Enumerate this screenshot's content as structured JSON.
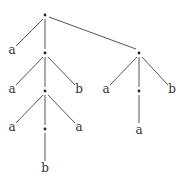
{
  "diagram": {
    "type": "tree",
    "nodes": [
      {
        "id": "n0",
        "kind": "internal",
        "x": 45,
        "y": 15
      },
      {
        "id": "n1",
        "kind": "leaf",
        "label": "a",
        "x": 12,
        "y": 52
      },
      {
        "id": "n2",
        "kind": "internal",
        "x": 45,
        "y": 53
      },
      {
        "id": "n3",
        "kind": "internal",
        "x": 139,
        "y": 53
      },
      {
        "id": "n4",
        "kind": "leaf",
        "label": "a",
        "x": 12,
        "y": 91
      },
      {
        "id": "n5",
        "kind": "internal",
        "x": 45,
        "y": 91
      },
      {
        "id": "n6",
        "kind": "leaf",
        "label": "b",
        "x": 79,
        "y": 91
      },
      {
        "id": "n7",
        "kind": "leaf",
        "label": "a",
        "x": 106,
        "y": 91
      },
      {
        "id": "n8",
        "kind": "internal",
        "x": 139,
        "y": 91
      },
      {
        "id": "n9",
        "kind": "leaf",
        "label": "b",
        "x": 172,
        "y": 91
      },
      {
        "id": "n10",
        "kind": "leaf",
        "label": "a",
        "x": 12,
        "y": 129
      },
      {
        "id": "n11",
        "kind": "internal",
        "x": 45,
        "y": 129
      },
      {
        "id": "n12",
        "kind": "leaf",
        "label": "a",
        "x": 79,
        "y": 129
      },
      {
        "id": "n13",
        "kind": "leaf",
        "label": "a",
        "x": 139,
        "y": 131
      },
      {
        "id": "n14",
        "kind": "leaf",
        "label": "b",
        "x": 45,
        "y": 169
      }
    ],
    "edges": [
      [
        "n0",
        "n1"
      ],
      [
        "n0",
        "n2"
      ],
      [
        "n0",
        "n3"
      ],
      [
        "n2",
        "n4"
      ],
      [
        "n2",
        "n5"
      ],
      [
        "n2",
        "n6"
      ],
      [
        "n3",
        "n7"
      ],
      [
        "n3",
        "n8"
      ],
      [
        "n3",
        "n9"
      ],
      [
        "n5",
        "n10"
      ],
      [
        "n5",
        "n11"
      ],
      [
        "n5",
        "n12"
      ],
      [
        "n8",
        "n13"
      ],
      [
        "n11",
        "n14"
      ]
    ],
    "labels": {
      "n1": "a",
      "n4": "a",
      "n6": "b",
      "n7": "a",
      "n9": "b",
      "n10": "a",
      "n12": "a",
      "n13": "a",
      "n14": "b"
    }
  }
}
